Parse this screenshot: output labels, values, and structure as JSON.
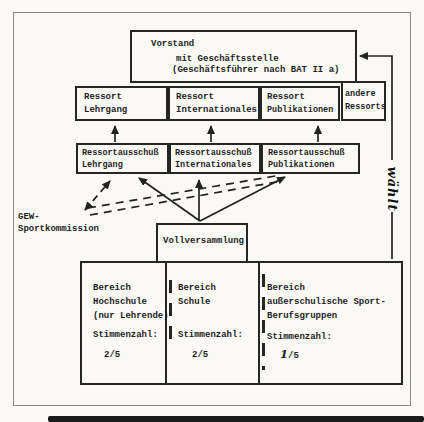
{
  "colors": {
    "ink": "#1f1f1f",
    "paper": "#faf9f6",
    "frame_gray": "#8a8a8a",
    "scan_band": "#1b1b1b"
  },
  "vorstand": {
    "line1": "Vorstand",
    "line2": "mit Geschäftsstelle",
    "line3": "(Geschäftsführer nach BAT II a)"
  },
  "ressorts": [
    {
      "line1": "Ressort",
      "line2": "Lehrgang"
    },
    {
      "line1": "Ressort",
      "line2": "Internationales"
    },
    {
      "line1": "Ressort",
      "line2": "Publikationen"
    },
    {
      "line1": "andere",
      "line2": "Ressorts"
    }
  ],
  "ausschuesse": [
    {
      "line1": "Ressortausschuß",
      "line2": "Lehrgang"
    },
    {
      "line1": "Ressortausschuß",
      "line2": "Internationales"
    },
    {
      "line1": "Ressortausschuß",
      "line2": "Publikationen"
    }
  ],
  "gew_sportkommission": {
    "line1": "GEW-",
    "line2": "Sportkommission"
  },
  "vollversammlung": {
    "label": "Vollversammlung"
  },
  "bereiche": [
    {
      "line1": "Bereich",
      "line2": "Hochschule",
      "line3": "(nur Lehrende)",
      "stimmen_label": "Stimmenzahl:",
      "stimmen_numer": "2",
      "stimmen_denom": "/5"
    },
    {
      "line1": "Bereich",
      "line2": "Schule",
      "line3": "",
      "stimmen_label": "Stimmenzahl:",
      "stimmen_numer": "2",
      "stimmen_denom": "/5"
    },
    {
      "line1": "Bereich",
      "line2": "außerschulische Sport-",
      "line3": "Berufsgruppen",
      "stimmen_label": "Stimmenzahl:",
      "stimmen_numer": "1",
      "stimmen_denom": "/5"
    }
  ],
  "handwriting": {
    "waehlt": "wählt"
  }
}
